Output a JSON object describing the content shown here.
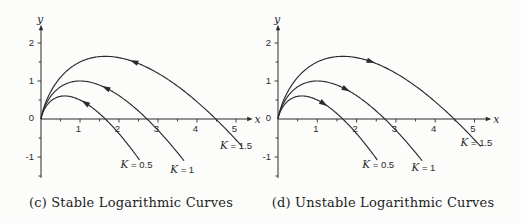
{
  "figure": {
    "background": "#fcfcfb",
    "ink": "#2b2b2b"
  },
  "chart_data": [
    {
      "type": "line",
      "id": "stable",
      "caption": "(c) Stable Logarithmic Curves",
      "xlabel": "x",
      "ylabel": "y",
      "x_ticks": [
        1,
        2,
        3,
        4,
        5
      ],
      "y_ticks": [
        -1,
        0,
        1,
        2
      ],
      "x_tick_labels": [
        "1",
        "2",
        "3",
        "4",
        "5"
      ],
      "y_tick_labels": [
        "-1",
        "0",
        "1",
        "2"
      ],
      "minor_tick_step": 0.5,
      "xlim": [
        0,
        5.3
      ],
      "ylim": [
        -1.55,
        2.35
      ],
      "grid": false,
      "legend_position": "none",
      "flow": "stable",
      "arrow_direction": "toward-origin",
      "series": [
        {
          "label": "K = 0.5",
          "K": 0.5,
          "start": [
            0,
            0
          ],
          "peak": [
            0.61,
            0.61
          ],
          "x_intercept": 1.65,
          "x_end": 2.52,
          "arrow_x": 1.15,
          "label_x": 2.45,
          "label_y": -1.3
        },
        {
          "label": "K = 1",
          "K": 1.0,
          "start": [
            0,
            0
          ],
          "peak": [
            1.0,
            1.0
          ],
          "x_intercept": 2.72,
          "x_end": 3.66,
          "arrow_x": 1.68,
          "label_x": 3.62,
          "label_y": -1.42
        },
        {
          "label": "K = 1.5",
          "K": 1.5,
          "start": [
            0,
            0
          ],
          "peak": [
            1.65,
            1.65
          ],
          "x_intercept": 4.48,
          "x_end": 5.15,
          "arrow_x": 2.4,
          "label_x": 5.0,
          "label_y": -0.78
        }
      ]
    },
    {
      "type": "line",
      "id": "unstable",
      "caption": "(d) Unstable Logarithmic Curves",
      "xlabel": "x",
      "ylabel": "y",
      "x_ticks": [
        1,
        2,
        3,
        4,
        5
      ],
      "y_ticks": [
        -1,
        0,
        1,
        2
      ],
      "x_tick_labels": [
        "1",
        "2",
        "3",
        "4",
        "5"
      ],
      "y_tick_labels": [
        "-1",
        "0",
        "1",
        "2"
      ],
      "minor_tick_step": 0.5,
      "xlim": [
        0,
        5.3
      ],
      "ylim": [
        -1.55,
        2.35
      ],
      "grid": false,
      "legend_position": "none",
      "flow": "unstable",
      "arrow_direction": "away-from-origin",
      "series": [
        {
          "label": "K = 0.5",
          "K": 0.5,
          "start": [
            0,
            0
          ],
          "peak": [
            0.61,
            0.61
          ],
          "x_intercept": 1.65,
          "x_end": 2.52,
          "arrow_x": 1.15,
          "label_x": 2.55,
          "label_y": -1.3
        },
        {
          "label": "K = 1",
          "K": 1.0,
          "start": [
            0,
            0
          ],
          "peak": [
            1.0,
            1.0
          ],
          "x_intercept": 2.72,
          "x_end": 3.66,
          "arrow_x": 1.72,
          "label_x": 3.7,
          "label_y": -1.36
        },
        {
          "label": "K = 1.5",
          "K": 1.5,
          "start": [
            0,
            0
          ],
          "peak": [
            1.65,
            1.65
          ],
          "x_intercept": 4.48,
          "x_end": 5.15,
          "arrow_x": 2.35,
          "label_x": 5.05,
          "label_y": -0.7
        }
      ]
    }
  ]
}
